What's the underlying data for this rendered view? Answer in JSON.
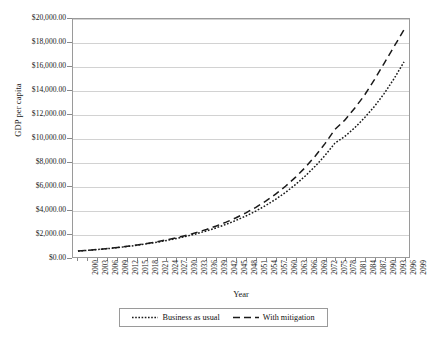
{
  "chart_data": {
    "type": "line",
    "title": "",
    "xlabel": "Year",
    "ylabel": "GDP per capita",
    "xlim": [
      2000,
      2099
    ],
    "ylim": [
      0,
      20000
    ],
    "grid": true,
    "legend_position": "bottom",
    "y_ticks": [
      0,
      2000,
      4000,
      6000,
      8000,
      10000,
      12000,
      14000,
      16000,
      18000,
      20000
    ],
    "y_tick_labels": [
      "$0.00",
      "$2,000.00",
      "$4,000.00",
      "$6,000.00",
      "$8,000.00",
      "$10,000.00",
      "$12,000.00",
      "$14,000.00",
      "$16,000.00",
      "$18,000.00",
      "$20,000.00"
    ],
    "x_tick_labels": [
      "2000",
      "2003",
      "2006",
      "2009",
      "2012",
      "2015",
      "2018",
      "2021",
      "2024",
      "2027",
      "2030",
      "2033",
      "2036",
      "2039",
      "2042",
      "2045",
      "2048",
      "2051",
      "2054",
      "2057",
      "2060",
      "2063",
      "2066",
      "2069",
      "2072",
      "2075",
      "2078",
      "2081",
      "2084",
      "2087",
      "2090",
      "2093",
      "2096",
      "2099"
    ],
    "x": [
      2000,
      2003,
      2006,
      2009,
      2012,
      2015,
      2018,
      2021,
      2024,
      2027,
      2030,
      2033,
      2036,
      2039,
      2042,
      2045,
      2048,
      2051,
      2054,
      2057,
      2060,
      2063,
      2066,
      2069,
      2072,
      2075,
      2078,
      2081,
      2084,
      2087,
      2090,
      2093,
      2096,
      2099
    ],
    "series": [
      {
        "name": "Business as usual",
        "style": "dotted",
        "color": "#1a1a1a",
        "values": [
          500,
          560,
          628,
          703,
          788,
          883,
          989,
          1108,
          1241,
          1391,
          1558,
          1745,
          1955,
          2190,
          2453,
          2748,
          3078,
          3448,
          3862,
          4326,
          4845,
          5426,
          6077,
          6806,
          7623,
          8537,
          9563,
          10129,
          10850,
          11700,
          12650,
          13750,
          15000,
          16400
        ]
      },
      {
        "name": "With mitigation",
        "style": "dashed",
        "color": "#1a1a1a",
        "values": [
          500,
          562,
          633,
          712,
          801,
          901,
          1014,
          1141,
          1283,
          1444,
          1625,
          1828,
          2057,
          2314,
          2604,
          2930,
          3297,
          3709,
          4174,
          4696,
          5283,
          5944,
          6687,
          7523,
          8464,
          9523,
          10715,
          11500,
          12500,
          13600,
          14900,
          16300,
          17700,
          19100
        ]
      }
    ]
  },
  "legend": {
    "entries": [
      {
        "label": "Business as usual",
        "style": "dotted"
      },
      {
        "label": "With mitigation",
        "style": "dashed"
      }
    ]
  },
  "axes": {
    "x_title": "Year",
    "y_title": "GDP per capita"
  }
}
